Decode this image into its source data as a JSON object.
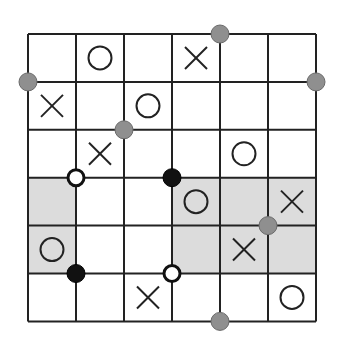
{
  "puzzle": {
    "rows": 6,
    "cols": 6,
    "grid": [
      [
        "",
        "O",
        "",
        "X",
        "",
        ""
      ],
      [
        "X",
        "",
        "O",
        "",
        "",
        ""
      ],
      [
        "",
        "X",
        "",
        "",
        "O",
        ""
      ],
      [
        "",
        "",
        "",
        "O",
        "",
        "X"
      ],
      [
        "O",
        "",
        "",
        "",
        "X",
        ""
      ],
      [
        "",
        "",
        "X",
        "",
        "",
        "O"
      ]
    ],
    "shaded_cells": [
      [
        3,
        0
      ],
      [
        3,
        3
      ],
      [
        3,
        4
      ],
      [
        3,
        5
      ],
      [
        4,
        0
      ],
      [
        4,
        3
      ],
      [
        4,
        4
      ],
      [
        4,
        5
      ]
    ],
    "dots": [
      {
        "col": 4,
        "row": 0,
        "type": "gray"
      },
      {
        "col": 0,
        "row": 1,
        "type": "gray"
      },
      {
        "col": 6,
        "row": 1,
        "type": "gray"
      },
      {
        "col": 2,
        "row": 2,
        "type": "gray"
      },
      {
        "col": 1,
        "row": 3,
        "type": "white"
      },
      {
        "col": 3,
        "row": 3,
        "type": "black"
      },
      {
        "col": 5,
        "row": 4,
        "type": "gray"
      },
      {
        "col": 1,
        "row": 5,
        "type": "black"
      },
      {
        "col": 3,
        "row": 5,
        "type": "white"
      },
      {
        "col": 4,
        "row": 6,
        "type": "gray"
      }
    ],
    "colors": {
      "line": "#222222",
      "shade": "#dcdcdc",
      "gray_dot": "#8f8f8f",
      "black_dot": "#111111",
      "white_dot": "#ffffff"
    }
  }
}
